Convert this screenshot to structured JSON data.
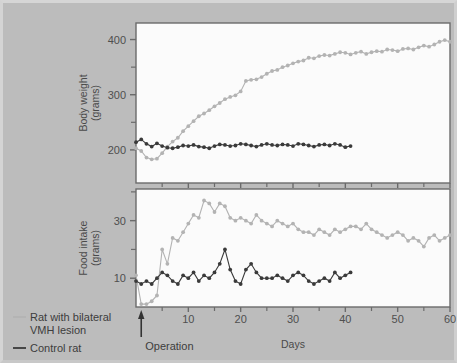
{
  "figure": {
    "background_color": "#bcbcbc",
    "plot_background_color": "#fbfbfb",
    "axis_color": "#6b6b6b"
  },
  "legend": {
    "position": "bottom-left",
    "entries": [
      {
        "label_line1": "Rat with bilateral",
        "label_line2": "VMH lesion",
        "color": "#b3b3b3",
        "key": "lesion"
      },
      {
        "label_line1": "Control rat",
        "label_line2": "",
        "color": "#3a3a3a",
        "key": "control"
      }
    ]
  },
  "annotations": {
    "operation_label": "Operation",
    "operation_day": 1
  },
  "chart_data": [
    {
      "type": "line",
      "panel": "top",
      "title": "",
      "xlabel": "",
      "ylabel": "Body weight\n(grams)",
      "ylabel_line1": "Body weight",
      "ylabel_line2": "(grams)",
      "xlim": [
        0,
        60
      ],
      "ylim": [
        140,
        430
      ],
      "xticks_major": [
        10,
        20,
        30,
        40,
        50,
        60
      ],
      "xticks_minor": [
        5,
        15,
        25,
        35,
        45,
        55
      ],
      "yticks_major": [
        200,
        300,
        400
      ],
      "yticks_minor": [
        250,
        350
      ],
      "grid": false,
      "legend_position": "outside-bottom-left",
      "series": [
        {
          "name": "Rat with bilateral VMH lesion",
          "color": "#b3b3b3",
          "marker": "circle",
          "x": [
            0,
            1,
            2,
            3,
            4,
            5,
            6,
            7,
            8,
            9,
            10,
            11,
            12,
            13,
            14,
            15,
            16,
            17,
            18,
            19,
            20,
            21,
            22,
            23,
            24,
            25,
            26,
            27,
            28,
            29,
            30,
            31,
            32,
            33,
            34,
            35,
            36,
            37,
            38,
            39,
            40,
            41,
            42,
            43,
            44,
            45,
            46,
            47,
            48,
            49,
            50,
            51,
            52,
            53,
            54,
            55,
            56,
            57,
            58,
            59,
            60
          ],
          "values": [
            203,
            198,
            186,
            183,
            184,
            194,
            206,
            215,
            222,
            234,
            243,
            252,
            261,
            266,
            272,
            279,
            285,
            292,
            296,
            299,
            306,
            325,
            327,
            328,
            332,
            338,
            343,
            345,
            350,
            353,
            357,
            360,
            362,
            367,
            366,
            370,
            372,
            371,
            374,
            377,
            376,
            373,
            376,
            378,
            374,
            377,
            379,
            378,
            382,
            381,
            379,
            383,
            384,
            382,
            386,
            389,
            387,
            391,
            396,
            399,
            396
          ]
        },
        {
          "name": "Control rat",
          "color": "#3a3a3a",
          "marker": "circle",
          "x": [
            0,
            1,
            2,
            3,
            4,
            5,
            6,
            7,
            8,
            9,
            10,
            11,
            12,
            13,
            14,
            15,
            16,
            17,
            18,
            19,
            20,
            21,
            22,
            23,
            24,
            25,
            26,
            27,
            28,
            29,
            30,
            31,
            32,
            33,
            34,
            35,
            36,
            37,
            38,
            39,
            40,
            41
          ],
          "values": [
            214,
            219,
            211,
            206,
            212,
            207,
            204,
            203,
            205,
            208,
            207,
            209,
            206,
            205,
            203,
            207,
            210,
            209,
            207,
            208,
            211,
            210,
            208,
            206,
            209,
            211,
            209,
            208,
            210,
            209,
            207,
            211,
            210,
            208,
            206,
            209,
            210,
            208,
            211,
            209,
            205,
            207
          ]
        }
      ]
    },
    {
      "type": "line",
      "panel": "bottom",
      "title": "",
      "xlabel": "Days",
      "ylabel": "Food intake\n(grams)",
      "ylabel_line1": "Food intake",
      "ylabel_line2": "(grams)",
      "xlim": [
        0,
        60
      ],
      "ylim": [
        0,
        41
      ],
      "xticks_major": [
        10,
        20,
        30,
        40,
        50,
        60
      ],
      "xticks_minor": [
        5,
        15,
        25,
        35,
        45,
        55
      ],
      "yticks_major": [
        10,
        30
      ],
      "yticks_minor": [
        20,
        40
      ],
      "grid": false,
      "legend_position": "outside-bottom-left",
      "series": [
        {
          "name": "Rat with bilateral VMH lesion",
          "color": "#b3b3b3",
          "marker": "circle",
          "x": [
            0,
            1,
            2,
            3,
            4,
            5,
            6,
            7,
            8,
            9,
            10,
            11,
            12,
            13,
            14,
            15,
            16,
            17,
            18,
            19,
            20,
            21,
            22,
            23,
            24,
            25,
            26,
            27,
            28,
            29,
            30,
            31,
            32,
            33,
            34,
            35,
            36,
            37,
            38,
            39,
            40,
            41,
            42,
            43,
            44,
            45,
            46,
            47,
            48,
            49,
            50,
            51,
            52,
            53,
            54,
            55,
            56,
            57,
            58,
            59,
            60
          ],
          "values": [
            11,
            1,
            1,
            2,
            4,
            20,
            15,
            24,
            23,
            26,
            29,
            32,
            31,
            37,
            36,
            33,
            36,
            35,
            31,
            30,
            31,
            30,
            29,
            32,
            30,
            29,
            28,
            30,
            29,
            28,
            29,
            27,
            26,
            26,
            25,
            27,
            26,
            25,
            27,
            26,
            27,
            28,
            28,
            27,
            29,
            27,
            26,
            25,
            24,
            25,
            26,
            25,
            23,
            24,
            23,
            21,
            24,
            25,
            23,
            24,
            25
          ]
        },
        {
          "name": "Control rat",
          "color": "#3a3a3a",
          "marker": "circle",
          "x": [
            0,
            1,
            2,
            3,
            4,
            5,
            6,
            7,
            8,
            9,
            10,
            11,
            12,
            13,
            14,
            15,
            16,
            17,
            18,
            19,
            20,
            21,
            22,
            23,
            24,
            25,
            26,
            27,
            28,
            29,
            30,
            31,
            32,
            33,
            34,
            35,
            36,
            37,
            38,
            39,
            40,
            41
          ],
          "values": [
            9,
            8,
            9,
            8,
            10,
            12,
            11,
            9,
            8,
            11,
            10,
            12,
            9,
            11,
            10,
            12,
            15,
            20,
            13,
            9,
            8,
            13,
            15,
            12,
            10,
            10,
            10,
            11,
            10,
            9,
            11,
            12,
            11,
            9,
            8,
            9,
            10,
            9,
            12,
            10,
            11,
            12
          ]
        }
      ]
    }
  ]
}
